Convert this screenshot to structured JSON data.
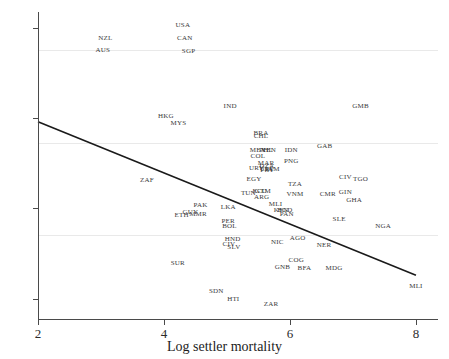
{
  "chart_data": {
    "type": "scatter",
    "title": "",
    "xlabel": "Log settler mortality",
    "ylabel": "",
    "xlim": [
      2,
      8.35
    ],
    "ylim": [
      3.55,
      10.35
    ],
    "xticks": [
      2,
      4,
      6,
      8
    ],
    "yticks": [
      4,
      6,
      8,
      10
    ],
    "grid": true,
    "grid_axis": "y",
    "point_label_mode": "text-only",
    "fit_line": {
      "type": "linear",
      "x_start": 2.0,
      "y_start": 7.92,
      "x_end": 8.0,
      "y_end": 4.52,
      "color": "#1a1a1a"
    },
    "points": [
      {
        "label": "USA",
        "x": 4.3,
        "y": 10.06
      },
      {
        "label": "NZL",
        "x": 3.07,
        "y": 9.78
      },
      {
        "label": "CAN",
        "x": 4.33,
        "y": 9.78
      },
      {
        "label": "AUS",
        "x": 3.03,
        "y": 9.5
      },
      {
        "label": "SGP",
        "x": 4.39,
        "y": 9.48
      },
      {
        "label": "IND",
        "x": 5.05,
        "y": 8.26
      },
      {
        "label": "GMB",
        "x": 7.12,
        "y": 8.27
      },
      {
        "label": "HKG",
        "x": 4.03,
        "y": 8.04
      },
      {
        "label": "MYS",
        "x": 4.23,
        "y": 7.9
      },
      {
        "label": "BRA",
        "x": 5.54,
        "y": 7.68
      },
      {
        "label": "CHL",
        "x": 5.54,
        "y": 7.6
      },
      {
        "label": "MEX",
        "x": 5.49,
        "y": 7.3
      },
      {
        "label": "PHL",
        "x": 5.62,
        "y": 7.3
      },
      {
        "label": "VEN",
        "x": 5.66,
        "y": 7.3
      },
      {
        "label": "COL",
        "x": 5.49,
        "y": 7.17
      },
      {
        "label": "MAR",
        "x": 5.62,
        "y": 7.01
      },
      {
        "label": "IDN",
        "x": 6.02,
        "y": 7.29
      },
      {
        "label": "GAB",
        "x": 6.55,
        "y": 7.38
      },
      {
        "label": "DZA",
        "x": 5.63,
        "y": 6.95
      },
      {
        "label": "URY",
        "x": 5.47,
        "y": 6.89
      },
      {
        "label": "CRI",
        "x": 5.62,
        "y": 6.88
      },
      {
        "label": "PRY",
        "x": 5.64,
        "y": 6.86
      },
      {
        "label": "PNG",
        "x": 6.02,
        "y": 7.05
      },
      {
        "label": "JAM",
        "x": 5.72,
        "y": 6.88
      },
      {
        "label": "EGY",
        "x": 5.43,
        "y": 6.64
      },
      {
        "label": "CIV",
        "x": 6.88,
        "y": 6.7
      },
      {
        "label": "TGO",
        "x": 7.12,
        "y": 6.66
      },
      {
        "label": "TUN",
        "x": 5.34,
        "y": 6.34
      },
      {
        "label": "ECU",
        "x": 5.52,
        "y": 6.39
      },
      {
        "label": "GTM",
        "x": 5.57,
        "y": 6.38
      },
      {
        "label": "ARG",
        "x": 5.55,
        "y": 6.26
      },
      {
        "label": "TZA",
        "x": 6.08,
        "y": 6.55
      },
      {
        "label": "VNM",
        "x": 6.08,
        "y": 6.32
      },
      {
        "label": "CMR",
        "x": 6.6,
        "y": 6.32
      },
      {
        "label": "GIN",
        "x": 6.88,
        "y": 6.36
      },
      {
        "label": "GHA",
        "x": 7.02,
        "y": 6.18
      },
      {
        "label": "LKA",
        "x": 5.02,
        "y": 6.02
      },
      {
        "label": "PAK",
        "x": 4.58,
        "y": 6.08
      },
      {
        "label": "GUY",
        "x": 4.42,
        "y": 5.93
      },
      {
        "label": "MMR",
        "x": 4.54,
        "y": 5.88
      },
      {
        "label": "ETH",
        "x": 4.28,
        "y": 5.86
      },
      {
        "label": "MLI",
        "x": 5.77,
        "y": 6.09
      },
      {
        "label": "KEN",
        "x": 5.86,
        "y": 5.97
      },
      {
        "label": "BGD",
        "x": 5.92,
        "y": 5.97
      },
      {
        "label": "PAN",
        "x": 5.95,
        "y": 5.88
      },
      {
        "label": "SLE",
        "x": 6.78,
        "y": 5.76
      },
      {
        "label": "PER",
        "x": 5.02,
        "y": 5.72
      },
      {
        "label": "BOL",
        "x": 5.04,
        "y": 5.62
      },
      {
        "label": "NGA",
        "x": 7.48,
        "y": 5.62
      },
      {
        "label": "HND",
        "x": 5.09,
        "y": 5.33
      },
      {
        "label": "NIC",
        "x": 5.8,
        "y": 5.26
      },
      {
        "label": "AGO",
        "x": 6.12,
        "y": 5.34
      },
      {
        "label": "SLV",
        "x": 5.11,
        "y": 5.15
      },
      {
        "label": "CIV2",
        "x": 5.03,
        "y": 5.22
      },
      {
        "label": "NER",
        "x": 6.54,
        "y": 5.18
      },
      {
        "label": "SUR",
        "x": 4.22,
        "y": 4.8
      },
      {
        "label": "GNB",
        "x": 5.88,
        "y": 4.7
      },
      {
        "label": "COG",
        "x": 6.1,
        "y": 4.85
      },
      {
        "label": "BFA",
        "x": 6.23,
        "y": 4.68
      },
      {
        "label": "MDG",
        "x": 6.7,
        "y": 4.68
      },
      {
        "label": "SDN",
        "x": 4.83,
        "y": 4.18
      },
      {
        "label": "HTI",
        "x": 5.1,
        "y": 4.0
      },
      {
        "label": "ZAR",
        "x": 5.7,
        "y": 3.88
      },
      {
        "label": "MLI2",
        "x": 8.0,
        "y": 4.28
      },
      {
        "label": "ZAF",
        "x": 3.73,
        "y": 6.63
      }
    ]
  }
}
